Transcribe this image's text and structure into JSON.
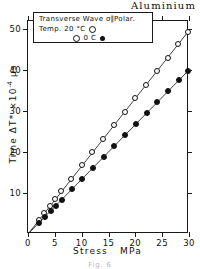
{
  "material_title": "Aluminium",
  "caption": "Fig. 6",
  "legend": {
    "line1_a": "Transverse  Wave",
    "line1_b": "σ",
    "line1_c": "∥",
    "line1_d": "Polar.",
    "line2_label": "Temp.  20 °C",
    "line2_symbol": "open-circle",
    "line3_label": "0  C",
    "line3_symbol": "filled-circle"
  },
  "axes": {
    "x_title": "Stress",
    "x_unit": "MPa",
    "y_title_main": "Time  ΔT* ×10",
    "y_title_exp": "-4",
    "y_title_unit": "μs",
    "x_ticks": [
      "0",
      "5",
      "10",
      "15",
      "20",
      "25",
      "30"
    ],
    "x_tick_values": [
      0,
      5,
      10,
      15,
      20,
      25,
      30
    ],
    "y_ticks": [
      "10",
      "20",
      "30",
      "40",
      "50"
    ],
    "y_tick_values": [
      10,
      20,
      30,
      40,
      50
    ],
    "xlim": [
      0,
      30
    ],
    "ylim": [
      0,
      52
    ]
  },
  "chart_data": {
    "type": "scatter",
    "title": "Aluminium",
    "subtitle": "Transverse Wave σ∥Polar.",
    "xlabel": "Stress  MPa",
    "ylabel": "Time ΔT* ×10-4 μs",
    "xlim": [
      0,
      30
    ],
    "ylim": [
      0,
      52
    ],
    "grid": false,
    "legend_position": "top-left-inset",
    "series": [
      {
        "name": "Temp. 20 °C",
        "marker": "open-circle",
        "color": "#111111",
        "fit_slope": 1.655,
        "fit_intercept": 0.0,
        "points": [
          {
            "x": 0.0,
            "y": 0.0
          },
          {
            "x": 2.0,
            "y": 3.4
          },
          {
            "x": 3.0,
            "y": 5.1
          },
          {
            "x": 4.1,
            "y": 6.9
          },
          {
            "x": 5.1,
            "y": 8.6
          },
          {
            "x": 6.2,
            "y": 10.4
          },
          {
            "x": 8.1,
            "y": 13.5
          },
          {
            "x": 10.1,
            "y": 16.8
          },
          {
            "x": 12.0,
            "y": 19.9
          },
          {
            "x": 14.0,
            "y": 23.2
          },
          {
            "x": 16.0,
            "y": 26.5
          },
          {
            "x": 18.0,
            "y": 29.8
          },
          {
            "x": 20.0,
            "y": 33.1
          },
          {
            "x": 22.0,
            "y": 36.4
          },
          {
            "x": 24.0,
            "y": 39.7
          },
          {
            "x": 26.0,
            "y": 43.0
          },
          {
            "x": 28.0,
            "y": 46.3
          },
          {
            "x": 29.8,
            "y": 49.3
          }
        ]
      },
      {
        "name": "0 C",
        "marker": "filled-circle",
        "color": "#111111",
        "fit_slope": 1.335,
        "fit_intercept": 0.0,
        "points": [
          {
            "x": 0.0,
            "y": 0.0
          },
          {
            "x": 2.1,
            "y": 2.8
          },
          {
            "x": 3.1,
            "y": 4.1
          },
          {
            "x": 4.2,
            "y": 5.6
          },
          {
            "x": 5.2,
            "y": 6.9
          },
          {
            "x": 6.3,
            "y": 8.4
          },
          {
            "x": 8.2,
            "y": 10.9
          },
          {
            "x": 10.1,
            "y": 13.5
          },
          {
            "x": 12.1,
            "y": 16.2
          },
          {
            "x": 14.1,
            "y": 18.8
          },
          {
            "x": 16.1,
            "y": 21.5
          },
          {
            "x": 18.1,
            "y": 24.2
          },
          {
            "x": 20.1,
            "y": 26.8
          },
          {
            "x": 22.1,
            "y": 29.5
          },
          {
            "x": 24.1,
            "y": 32.2
          },
          {
            "x": 26.1,
            "y": 34.8
          },
          {
            "x": 28.1,
            "y": 37.5
          },
          {
            "x": 29.9,
            "y": 39.9
          }
        ]
      }
    ]
  }
}
